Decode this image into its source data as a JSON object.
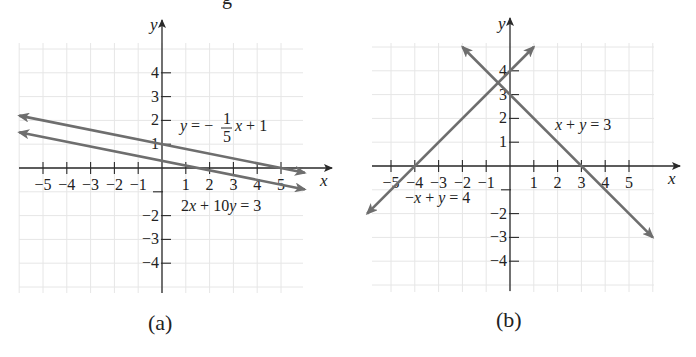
{
  "header_fragment": "g",
  "chart_data": [
    {
      "type": "line",
      "panel": "a",
      "caption": "(a)",
      "xlabel": "x",
      "ylabel": "y",
      "xlim": [
        -6,
        6
      ],
      "ylim": [
        -5,
        5
      ],
      "grid": true,
      "x_ticks": [
        -5,
        -4,
        -3,
        -2,
        -1,
        1,
        2,
        3,
        4,
        5
      ],
      "x_tick_labels": [
        "−5",
        "−4",
        "−3",
        "−2",
        "−1",
        "1",
        "2",
        "3",
        "4",
        "5"
      ],
      "y_ticks": [
        4,
        3,
        2,
        1,
        -1,
        -2,
        -3,
        -4
      ],
      "y_tick_labels": [
        "4",
        "3",
        "2",
        "1",
        "",
        "−2",
        "−3",
        "−4"
      ],
      "series": [
        {
          "name": "y = −(1/5)x + 1",
          "label_parts": {
            "lhs": "y",
            "eq": " = −",
            "num": "1",
            "den": "5",
            "rhs": "x + 1"
          },
          "slope": -0.2,
          "intercept": 1,
          "x": [
            -6,
            6
          ],
          "y": [
            2.2,
            -0.2
          ]
        },
        {
          "name": "2x + 10y = 3",
          "label": "2x + 10y = 3",
          "slope": -0.2,
          "intercept": 0.3,
          "x": [
            -6,
            6
          ],
          "y": [
            1.5,
            -0.9
          ]
        }
      ],
      "annotation": "Parallel lines — no solution"
    },
    {
      "type": "line",
      "panel": "b",
      "caption": "(b)",
      "xlabel": "x",
      "ylabel": "y",
      "xlim": [
        -6,
        6
      ],
      "ylim": [
        -5,
        5
      ],
      "grid": true,
      "x_ticks": [
        -5,
        -4,
        -3,
        -2,
        -1,
        1,
        2,
        3,
        4,
        5
      ],
      "x_tick_labels": [
        "−5",
        "−4",
        "−3",
        "−2",
        "−1",
        "1",
        "2",
        "3",
        "4",
        "5"
      ],
      "y_ticks": [
        4,
        3,
        2,
        1,
        -1,
        -2,
        -3,
        -4
      ],
      "y_tick_labels": [
        "4",
        "3",
        "2",
        "1",
        "",
        "−2",
        "−3",
        "−4"
      ],
      "series": [
        {
          "name": "x + y = 3",
          "label": "x + y = 3",
          "slope": -1,
          "intercept": 3,
          "x": [
            -2,
            6
          ],
          "y": [
            5,
            -3
          ]
        },
        {
          "name": "−x + y = 4",
          "label": "−x + y = 4",
          "slope": 1,
          "intercept": 4,
          "x": [
            -6,
            1
          ],
          "y": [
            -2,
            5
          ]
        }
      ],
      "intersection": [
        -0.5,
        3.5
      ]
    }
  ],
  "colors": {
    "line": "#6e6e6e",
    "axis": "#2a2a2a",
    "grid": "#e6e6e6",
    "text": "#222222"
  }
}
